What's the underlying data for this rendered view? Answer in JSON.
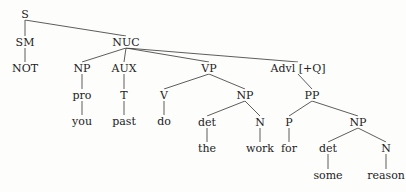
{
  "tree": {
    "nodes": [
      {
        "id": "S",
        "label": "S",
        "x": 25,
        "y": 14
      },
      {
        "id": "SM",
        "label": "SM",
        "x": 25,
        "y": 42
      },
      {
        "id": "NOT",
        "label": "NOT",
        "x": 25,
        "y": 68
      },
      {
        "id": "NUC",
        "label": "NUC",
        "x": 126,
        "y": 42
      },
      {
        "id": "NP1",
        "label": "NP",
        "x": 82,
        "y": 68
      },
      {
        "id": "pro",
        "label": "pro",
        "x": 82,
        "y": 95
      },
      {
        "id": "you",
        "label": "you",
        "x": 82,
        "y": 121
      },
      {
        "id": "AUX",
        "label": "AUX",
        "x": 124,
        "y": 68
      },
      {
        "id": "T",
        "label": "T",
        "x": 124,
        "y": 95
      },
      {
        "id": "past",
        "label": "past",
        "x": 124,
        "y": 121
      },
      {
        "id": "VP",
        "label": "VP",
        "x": 209,
        "y": 68
      },
      {
        "id": "V",
        "label": "V",
        "x": 164,
        "y": 95
      },
      {
        "id": "do",
        "label": "do",
        "x": 164,
        "y": 121
      },
      {
        "id": "NP2",
        "label": "NP",
        "x": 245,
        "y": 95
      },
      {
        "id": "det1",
        "label": "det",
        "x": 207,
        "y": 122
      },
      {
        "id": "the",
        "label": "the",
        "x": 207,
        "y": 148
      },
      {
        "id": "N1",
        "label": "N",
        "x": 260,
        "y": 122
      },
      {
        "id": "work",
        "label": "work",
        "x": 260,
        "y": 148
      },
      {
        "id": "Advl",
        "label": "Advl [+Q]",
        "x": 298,
        "y": 68
      },
      {
        "id": "PP",
        "label": "PP",
        "x": 312,
        "y": 95
      },
      {
        "id": "P",
        "label": "P",
        "x": 289,
        "y": 122
      },
      {
        "id": "for",
        "label": "for",
        "x": 289,
        "y": 148
      },
      {
        "id": "NP3",
        "label": "NP",
        "x": 358,
        "y": 122
      },
      {
        "id": "det2",
        "label": "det",
        "x": 328,
        "y": 148
      },
      {
        "id": "some",
        "label": "some",
        "x": 328,
        "y": 175
      },
      {
        "id": "N2",
        "label": "N",
        "x": 386,
        "y": 148
      },
      {
        "id": "reason",
        "label": "reason",
        "x": 386,
        "y": 175
      }
    ],
    "edges": [
      [
        "S",
        "SM"
      ],
      [
        "S",
        "NUC"
      ],
      [
        "SM",
        "NOT"
      ],
      [
        "NUC",
        "NP1"
      ],
      [
        "NUC",
        "AUX"
      ],
      [
        "NUC",
        "VP"
      ],
      [
        "NUC",
        "Advl"
      ],
      [
        "NP1",
        "pro"
      ],
      [
        "pro",
        "you"
      ],
      [
        "AUX",
        "T"
      ],
      [
        "T",
        "past"
      ],
      [
        "VP",
        "V"
      ],
      [
        "VP",
        "NP2"
      ],
      [
        "V",
        "do"
      ],
      [
        "NP2",
        "det1"
      ],
      [
        "NP2",
        "N1"
      ],
      [
        "det1",
        "the"
      ],
      [
        "N1",
        "work"
      ],
      [
        "Advl",
        "PP"
      ],
      [
        "PP",
        "P"
      ],
      [
        "PP",
        "NP3"
      ],
      [
        "P",
        "for"
      ],
      [
        "NP3",
        "det2"
      ],
      [
        "NP3",
        "N2"
      ],
      [
        "det2",
        "some"
      ],
      [
        "N2",
        "reason"
      ]
    ],
    "colors": {
      "line": "#333333",
      "text": "#222222",
      "background": "#fdfdfc"
    }
  }
}
